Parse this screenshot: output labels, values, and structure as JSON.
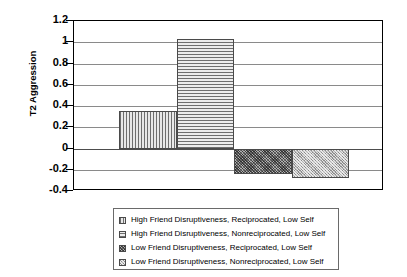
{
  "chart_data": {
    "type": "bar",
    "title": "",
    "xlabel": "",
    "ylabel": "T2 Aggression",
    "ylim": [
      -0.4,
      1.2
    ],
    "yticks": [
      "1.2",
      "1",
      "0.8",
      "0.6",
      "0.4",
      "0.2",
      "0",
      "-0.2",
      "-0.4"
    ],
    "ytick_values": [
      1.2,
      1,
      0.8,
      0.6,
      0.4,
      0.2,
      0,
      -0.2,
      -0.4
    ],
    "grid": true,
    "legend_position": "below",
    "xtick_labels": [],
    "categories": [
      "High Friend Disruptiveness, Reciprocated, Low Self",
      "High Friend Disruptiveness, Nonreciprocated, Low Self",
      "Low Friend Disruptiveness, Reciprocated, Low Self",
      "Low Friend Disruptiveness, Nonreciprocated, Low Self"
    ],
    "values": [
      0.35,
      1.03,
      -0.24,
      -0.28
    ],
    "bars": [
      {
        "label": "High Friend Disruptiveness, Reciprocated, Low Self",
        "value": 0.35,
        "pattern": "vertical-stripes"
      },
      {
        "label": "High Friend Disruptiveness, Nonreciprocated, Low Self",
        "value": 1.03,
        "pattern": "horizontal-stripes"
      },
      {
        "label": "Low Friend Disruptiveness, Reciprocated, Low Self",
        "value": -0.24,
        "pattern": "dark-crosshatch"
      },
      {
        "label": "Low Friend Disruptiveness, Nonreciprocated, Low Self",
        "value": -0.28,
        "pattern": "light-crosshatch"
      }
    ]
  },
  "axis": {
    "y_title": "T2 Aggression",
    "ticks": [
      {
        "label": "1.2"
      },
      {
        "label": "1"
      },
      {
        "label": "0.8"
      },
      {
        "label": "0.6"
      },
      {
        "label": "0.4"
      },
      {
        "label": "0.2"
      },
      {
        "label": "0"
      },
      {
        "label": "-0.2"
      },
      {
        "label": "-0.4"
      }
    ]
  },
  "legend": {
    "items": [
      {
        "label": "High Friend Disruptiveness, Reciprocated, Low Self"
      },
      {
        "label": "High Friend Disruptiveness, Nonreciprocated, Low Self"
      },
      {
        "label": "Low Friend Disruptiveness, Reciprocated, Low Self"
      },
      {
        "label": "Low Friend Disruptiveness, Nonreciprocated, Low Self"
      }
    ]
  },
  "colors": {
    "frame": "#000000",
    "gridline": "#8a8a8a",
    "bar_border": "#4a4a4a",
    "background": "#ffffff"
  }
}
